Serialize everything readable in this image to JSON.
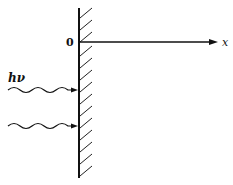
{
  "diagram": {
    "origin_label": "0",
    "axis_label": "x",
    "photon_label": "hν",
    "elements": {
      "wall": "hatched vertical surface (metal) at x = 0",
      "axis": "horizontal x-axis pointing right from origin",
      "photons": "two wavy arrows incident on surface from the left"
    },
    "colors": {
      "ink": "#111111",
      "background": "#ffffff"
    }
  }
}
